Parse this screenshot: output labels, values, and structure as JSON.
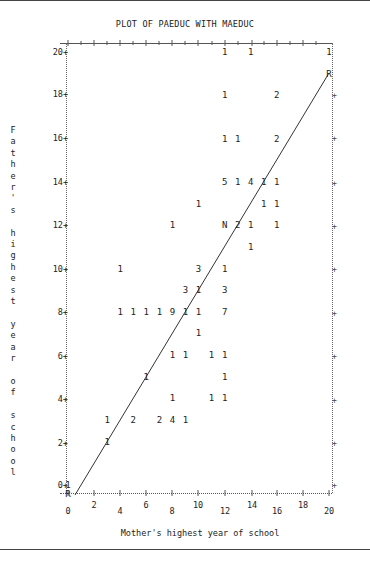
{
  "page": {
    "title": "PLOT OF PAEDUC WITH MAEDUC"
  },
  "chart_data": {
    "type": "scatter",
    "title": "PLOT OF PAEDUC WITH MAEDUC",
    "xlabel": "Mother's highest year of school",
    "ylabel": "Father's highest year of school",
    "xlim": [
      0,
      20
    ],
    "ylim": [
      0,
      20
    ],
    "x_ticks": [
      "0",
      "2",
      "4",
      "6",
      "8",
      "10",
      "12",
      "14",
      "16",
      "18",
      "20"
    ],
    "y_ticks": [
      "0",
      "2",
      "4",
      "6",
      "8",
      "10",
      "12",
      "14",
      "16",
      "18",
      "20"
    ],
    "grid": false,
    "legend": null,
    "symbol_note": "Digits denote number of observations at a position; N marks overlapping point; R marks regression line endpoints",
    "points": [
      {
        "x": 12,
        "y": 20,
        "label": "1"
      },
      {
        "x": 14,
        "y": 20,
        "label": "1"
      },
      {
        "x": 20,
        "y": 20,
        "label": "1"
      },
      {
        "x": 20,
        "y": 19,
        "label": "R"
      },
      {
        "x": 12,
        "y": 18,
        "label": "1"
      },
      {
        "x": 16,
        "y": 18,
        "label": "2"
      },
      {
        "x": 12,
        "y": 16,
        "label": "1"
      },
      {
        "x": 13,
        "y": 16,
        "label": "1"
      },
      {
        "x": 16,
        "y": 16,
        "label": "2"
      },
      {
        "x": 12,
        "y": 14,
        "label": "5"
      },
      {
        "x": 13,
        "y": 14,
        "label": "1"
      },
      {
        "x": 14,
        "y": 14,
        "label": "4"
      },
      {
        "x": 15,
        "y": 14,
        "label": "1"
      },
      {
        "x": 16,
        "y": 14,
        "label": "1"
      },
      {
        "x": 10,
        "y": 13,
        "label": "1"
      },
      {
        "x": 15,
        "y": 13,
        "label": "1"
      },
      {
        "x": 16,
        "y": 13,
        "label": "1"
      },
      {
        "x": 8,
        "y": 12,
        "label": "1"
      },
      {
        "x": 12,
        "y": 12,
        "label": "N"
      },
      {
        "x": 13,
        "y": 12,
        "label": "2"
      },
      {
        "x": 14,
        "y": 12,
        "label": "1"
      },
      {
        "x": 16,
        "y": 12,
        "label": "1"
      },
      {
        "x": 14,
        "y": 11,
        "label": "1"
      },
      {
        "x": 4,
        "y": 10,
        "label": "1"
      },
      {
        "x": 10,
        "y": 10,
        "label": "3"
      },
      {
        "x": 12,
        "y": 10,
        "label": "1"
      },
      {
        "x": 9,
        "y": 9,
        "label": "3"
      },
      {
        "x": 10,
        "y": 9,
        "label": "1"
      },
      {
        "x": 12,
        "y": 9,
        "label": "3"
      },
      {
        "x": 4,
        "y": 8,
        "label": "1"
      },
      {
        "x": 5,
        "y": 8,
        "label": "1"
      },
      {
        "x": 6,
        "y": 8,
        "label": "1"
      },
      {
        "x": 7,
        "y": 8,
        "label": "1"
      },
      {
        "x": 8,
        "y": 8,
        "label": "9"
      },
      {
        "x": 9,
        "y": 8,
        "label": "1"
      },
      {
        "x": 10,
        "y": 8,
        "label": "1"
      },
      {
        "x": 12,
        "y": 8,
        "label": "7"
      },
      {
        "x": 10,
        "y": 7,
        "label": "1"
      },
      {
        "x": 8,
        "y": 6,
        "label": "1"
      },
      {
        "x": 9,
        "y": 6,
        "label": "1"
      },
      {
        "x": 11,
        "y": 6,
        "label": "1"
      },
      {
        "x": 12,
        "y": 6,
        "label": "1"
      },
      {
        "x": 6,
        "y": 5,
        "label": "1"
      },
      {
        "x": 12,
        "y": 5,
        "label": "1"
      },
      {
        "x": 8,
        "y": 4,
        "label": "1"
      },
      {
        "x": 11,
        "y": 4,
        "label": "1"
      },
      {
        "x": 12,
        "y": 4,
        "label": "1"
      },
      {
        "x": 3,
        "y": 3,
        "label": "1"
      },
      {
        "x": 5,
        "y": 3,
        "label": "2"
      },
      {
        "x": 7,
        "y": 3,
        "label": "2"
      },
      {
        "x": 8,
        "y": 3,
        "label": "4"
      },
      {
        "x": 9,
        "y": 3,
        "label": "1"
      },
      {
        "x": 3,
        "y": 2,
        "label": "1"
      },
      {
        "x": 0,
        "y": 0,
        "label": "1"
      },
      {
        "x": 0,
        "y": -0.4,
        "label": "R"
      }
    ],
    "regression_line": {
      "x1": 0.5,
      "y1": -0.4,
      "x2": 20,
      "y2": 19
    }
  },
  "axes": {
    "y_tick_labels": [
      "20+",
      "18+",
      "16+",
      "14+",
      "12+",
      "10+",
      "8+",
      "6+",
      "4+",
      "2+",
      "0+"
    ],
    "x_tick_labels": [
      "0",
      "2",
      "4",
      "6",
      "8",
      "10",
      "12",
      "14",
      "16",
      "18",
      "20"
    ],
    "y_title_chars": "F\na\nt\nh\ne\nr\n'\ns\n\nh\ni\ng\nh\ne\ns\nt\n\ny\ne\na\nr\n\no\nf\n\ns\nc\nh\no\no\nl",
    "x_title": "Mother's highest year of school"
  }
}
